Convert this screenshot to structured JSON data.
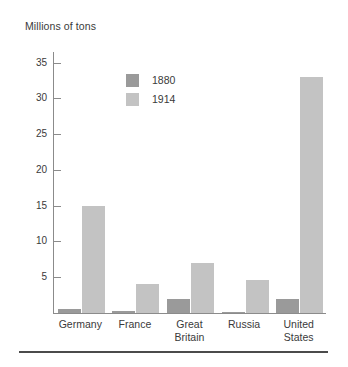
{
  "chart_data": {
    "type": "bar",
    "title": "Millions of tons",
    "xlabel": "",
    "ylabel": "",
    "ylim": [
      0,
      36.5
    ],
    "yticks": [
      5,
      10,
      15,
      20,
      25,
      30,
      35
    ],
    "ytick_labels": [
      "5",
      "10",
      "15",
      "20",
      "25",
      "30",
      "35"
    ],
    "grid": false,
    "legend_position": "inside-upper-left",
    "categories": [
      "Germany",
      "France",
      "Great Britain",
      "Russia",
      "United States"
    ],
    "category_lines": [
      [
        "Germany"
      ],
      [
        "France"
      ],
      [
        "Great",
        "Britain"
      ],
      [
        "Russia"
      ],
      [
        "United",
        "States"
      ]
    ],
    "series": [
      {
        "name": "1880",
        "color": "#9a9a9a",
        "values": [
          0.6,
          0.3,
          2.0,
          0.2,
          2.0
        ]
      },
      {
        "name": "1914",
        "color": "#c3c3c3",
        "values": [
          15.0,
          4.0,
          7.0,
          4.6,
          33.0
        ]
      }
    ]
  },
  "legend": {
    "items": [
      {
        "label": "1880",
        "color": "#9a9a9a"
      },
      {
        "label": "1914",
        "color": "#c3c3c3"
      }
    ]
  },
  "colors": {
    "series_1880": "#9a9a9a",
    "series_1914": "#c3c3c3",
    "axis": "#8b8b8b",
    "text": "#3a3a3a",
    "rule": "#4b4b4b",
    "background": "#ffffff"
  }
}
